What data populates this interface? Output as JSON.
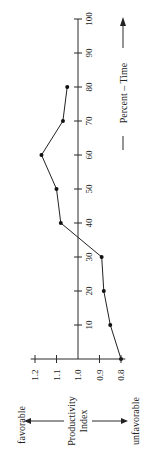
{
  "chart_data": {
    "type": "line",
    "orientation": "rotated-90-ccw",
    "title": "",
    "xlabel": "Percent – Time",
    "ylabel": "Productivity Index",
    "x_ticks": [
      10,
      20,
      30,
      40,
      50,
      60,
      70,
      80,
      90,
      100
    ],
    "y_ticks": [
      "0.8",
      "0.9",
      "1.0",
      "1.1",
      "1.2"
    ],
    "xlim": [
      0,
      100
    ],
    "ylim": [
      0.8,
      1.2
    ],
    "y_direction_labels": {
      "favorable": "favorable",
      "unfavorable": "unfavorable"
    },
    "grid": false,
    "legend": null,
    "series": [
      {
        "name": "Productivity Index",
        "x": [
          0,
          10,
          20,
          30,
          40,
          50,
          60,
          70,
          80
        ],
        "values": [
          0.8,
          0.85,
          0.88,
          0.89,
          1.08,
          1.1,
          1.17,
          1.07,
          1.05
        ]
      }
    ]
  },
  "labels": {
    "time_axis": "Percent – Time",
    "index_line1": "Productivity",
    "index_line2": "Index",
    "favorable": "favorable",
    "unfavorable": "unfavorable"
  },
  "colors": {
    "ink": "#222222",
    "background": "#ffffff"
  }
}
